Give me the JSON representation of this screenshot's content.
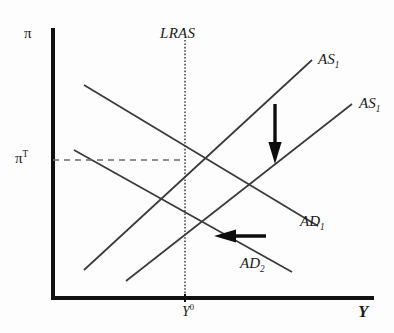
{
  "figure": {
    "type": "economics-diagram",
    "axes": {
      "y_label": "π",
      "y_label_name": "inflation",
      "x_label": "Y",
      "x_label_name": "output",
      "y_tick_label": "π",
      "y_tick_superscript": "T",
      "x_tick_label": "Y",
      "x_tick_superscript": "0",
      "origin_x": 53,
      "origin_y": 298,
      "x_axis_end": 370,
      "y_axis_top": 30
    },
    "curves": [
      {
        "name": "LRAS",
        "label": "LRAS",
        "style": "dotted-vertical",
        "x": 185,
        "y_start": 40,
        "y_end": 298
      },
      {
        "name": "AS1",
        "label": "AS",
        "subscript": "1",
        "style": "solid-upward",
        "x1": 84,
        "y1": 270,
        "x2": 312,
        "y2": 60
      },
      {
        "name": "AS2",
        "label": "AS",
        "subscript": "1",
        "style": "solid-upward",
        "x1": 126,
        "y1": 281,
        "x2": 352,
        "y2": 104
      },
      {
        "name": "AD1",
        "label": "AD",
        "subscript": "1",
        "style": "solid-downward",
        "x1": 84,
        "y1": 85,
        "x2": 318,
        "y2": 226
      },
      {
        "name": "AD2",
        "label": "AD",
        "subscript": "2",
        "style": "solid-downward",
        "x1": 74,
        "y1": 150,
        "x2": 292,
        "y2": 272
      }
    ],
    "dashed_guide": {
      "name": "inflation-target-guide",
      "x1": 53,
      "y1": 160,
      "x2": 185,
      "y2": 160,
      "style": "dashed-horizontal"
    },
    "equilibria": [
      {
        "name": "initial-equilibrium",
        "x": 185,
        "y": 160
      },
      {
        "name": "new-equilibrium",
        "x": 186,
        "y": 236
      }
    ],
    "arrows": [
      {
        "name": "as-shift-down-arrow",
        "direction": "down",
        "x1": 275,
        "y1": 104,
        "x2": 275,
        "y2": 162
      },
      {
        "name": "ad-shift-left-arrow",
        "direction": "left",
        "x1": 266,
        "y1": 236,
        "x2": 215,
        "y2": 236
      }
    ],
    "colors": {
      "ink": "#1a1a1a",
      "line": "#3a3a3a",
      "axis": "#111111",
      "background": "#fdfdfd"
    }
  }
}
